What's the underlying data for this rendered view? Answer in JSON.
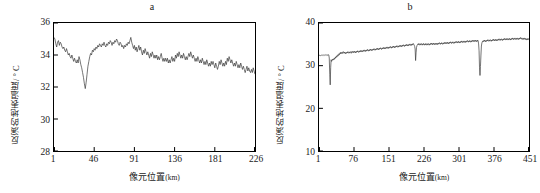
{
  "figure": {
    "panels": [
      {
        "id": "a",
        "title": "a",
        "ylabel": "反演的地表温度/ ° C",
        "xlabel_main": "像元位置",
        "xlabel_unit": "(km)"
      },
      {
        "id": "b",
        "title": "b",
        "ylabel": "反演的地表温度/ ° C",
        "xlabel_main": "像元位置",
        "xlabel_unit": "(km)"
      }
    ]
  },
  "chart_data": [
    {
      "type": "line",
      "title": "a",
      "xlabel": "像元位置(km)",
      "ylabel": "反演的地表温度/ ° C",
      "xlim": [
        1,
        226
      ],
      "ylim": [
        28,
        36
      ],
      "xticks": [
        1,
        46,
        91,
        136,
        181,
        226
      ],
      "yticks": [
        28,
        30,
        32,
        34,
        36
      ],
      "grid": false,
      "legend": "none",
      "line_color": "#3a3a3a",
      "series": [
        {
          "name": "反演的地表温度",
          "x_start": 1,
          "x_step": 1,
          "values": [
            35.1,
            35.0,
            34.7,
            34.5,
            34.8,
            34.9,
            34.6,
            34.8,
            34.7,
            34.5,
            34.4,
            34.5,
            34.3,
            34.2,
            34.4,
            34.2,
            34.0,
            34.1,
            33.9,
            33.8,
            34.0,
            33.8,
            33.6,
            33.8,
            33.6,
            33.5,
            33.7,
            33.5,
            33.9,
            33.7,
            33.4,
            33.2,
            32.9,
            32.6,
            32.2,
            31.9,
            32.3,
            32.8,
            33.3,
            33.6,
            33.9,
            34.1,
            34.0,
            34.3,
            34.2,
            34.4,
            34.3,
            34.5,
            34.4,
            34.6,
            34.5,
            34.7,
            34.6,
            34.5,
            34.7,
            34.6,
            34.8,
            34.6,
            34.5,
            34.7,
            34.6,
            34.8,
            34.7,
            34.9,
            34.8,
            34.6,
            34.8,
            34.7,
            34.9,
            34.8,
            35.0,
            34.9,
            34.7,
            34.6,
            34.8,
            34.7,
            34.5,
            34.6,
            34.4,
            34.6,
            34.5,
            34.7,
            34.6,
            34.8,
            34.7,
            34.9,
            35.1,
            34.8,
            34.6,
            34.4,
            34.6,
            34.3,
            34.5,
            34.2,
            34.4,
            34.6,
            34.3,
            34.5,
            34.2,
            34.0,
            34.3,
            34.1,
            34.4,
            34.2,
            34.0,
            34.2,
            34.0,
            33.8,
            34.1,
            33.9,
            34.2,
            34.0,
            33.8,
            34.0,
            33.8,
            34.0,
            33.7,
            33.9,
            33.7,
            33.9,
            34.1,
            33.8,
            33.6,
            33.8,
            33.6,
            33.8,
            33.6,
            33.8,
            33.5,
            33.7,
            33.5,
            33.7,
            33.9,
            33.6,
            33.8,
            33.6,
            34.0,
            33.8,
            34.1,
            33.9,
            34.2,
            34.0,
            33.8,
            34.0,
            33.8,
            34.1,
            33.9,
            33.7,
            33.9,
            33.7,
            33.9,
            34.1,
            33.9,
            34.2,
            34.0,
            33.8,
            34.0,
            33.8,
            33.6,
            33.8,
            33.6,
            33.9,
            33.7,
            33.5,
            33.7,
            33.5,
            33.8,
            33.6,
            33.4,
            33.6,
            33.4,
            33.7,
            33.5,
            33.3,
            33.5,
            33.3,
            33.6,
            33.4,
            33.6,
            33.4,
            33.2,
            33.5,
            33.3,
            33.1,
            33.3,
            33.6,
            33.4,
            33.7,
            33.5,
            33.3,
            33.5,
            33.3,
            33.6,
            33.4,
            33.8,
            33.6,
            33.9,
            33.7,
            33.5,
            33.7,
            33.5,
            33.3,
            33.5,
            33.3,
            33.6,
            33.4,
            33.2,
            33.4,
            33.2,
            33.5,
            33.3,
            33.1,
            33.3,
            33.1,
            32.9,
            33.1,
            33.3,
            33.0,
            33.2,
            33.0,
            32.9,
            33.1,
            32.9,
            33.2,
            33.0,
            32.8
          ]
        }
      ]
    },
    {
      "type": "line",
      "title": "b",
      "xlabel": "像元位置(km)",
      "ylabel": "反演的地表温度/ ° C",
      "xlim": [
        1,
        451
      ],
      "ylim": [
        10,
        40
      ],
      "xticks": [
        1,
        76,
        151,
        226,
        301,
        376,
        451
      ],
      "yticks": [
        10,
        20,
        30,
        40
      ],
      "grid": false,
      "legend": "none",
      "line_color": "#3a3a3a",
      "series": [
        {
          "name": "反演的地表温度",
          "x_start": 1,
          "x_step": 1,
          "values": [
            32.4,
            32.4,
            32.5,
            32.4,
            32.3,
            32.4,
            32.5,
            32.4,
            32.5,
            32.4,
            32.5,
            32.4,
            32.5,
            32.6,
            32.5,
            32.4,
            32.5,
            32.4,
            32.5,
            32.4,
            32.6,
            32.5,
            31.8,
            28.0,
            25.5,
            29.5,
            31.4,
            31.0,
            31.2,
            31.5,
            31.3,
            31.6,
            31.4,
            31.8,
            31.6,
            32.0,
            31.8,
            32.2,
            32.0,
            32.4,
            32.2,
            32.6,
            32.4,
            32.8,
            32.6,
            33.0,
            32.8,
            33.2,
            33.0,
            32.8,
            33.1,
            32.9,
            33.3,
            33.1,
            32.9,
            33.2,
            33.0,
            32.8,
            33.1,
            32.9,
            33.2,
            33.0,
            33.3,
            33.1,
            32.9,
            33.2,
            33.0,
            33.3,
            33.1,
            32.9,
            33.2,
            33.4,
            33.2,
            33.0,
            33.3,
            33.1,
            33.4,
            33.2,
            33.0,
            33.3,
            33.1,
            33.4,
            33.2,
            33.5,
            33.3,
            33.1,
            33.4,
            33.2,
            33.5,
            33.3,
            33.6,
            33.4,
            33.2,
            33.5,
            33.3,
            33.6,
            33.4,
            33.7,
            33.5,
            33.3,
            33.6,
            33.4,
            33.7,
            33.5,
            33.8,
            33.6,
            33.4,
            33.7,
            33.5,
            33.8,
            33.6,
            33.9,
            33.7,
            33.5,
            33.8,
            33.6,
            33.9,
            33.7,
            34.0,
            33.8,
            33.6,
            33.9,
            33.7,
            34.0,
            33.8,
            34.1,
            33.9,
            33.7,
            34.0,
            33.8,
            34.1,
            33.9,
            34.2,
            34.0,
            33.8,
            34.1,
            33.9,
            34.2,
            34.0,
            34.3,
            34.1,
            33.9,
            34.2,
            34.0,
            34.3,
            34.1,
            34.4,
            34.2,
            34.0,
            34.3,
            34.1,
            34.4,
            34.2,
            34.5,
            34.3,
            34.1,
            34.4,
            34.2,
            34.5,
            34.3,
            34.6,
            34.4,
            34.2,
            34.5,
            34.3,
            34.6,
            34.4,
            34.7,
            34.5,
            34.3,
            34.6,
            34.4,
            34.7,
            34.5,
            34.8,
            34.6,
            34.4,
            34.7,
            34.5,
            34.8,
            34.6,
            34.9,
            34.7,
            34.5,
            34.8,
            34.6,
            34.9,
            34.7,
            35.0,
            34.8,
            34.6,
            34.9,
            34.7,
            35.0,
            34.8,
            35.1,
            34.9,
            34.7,
            35.0,
            34.8,
            35.1,
            34.9,
            35.2,
            35.0,
            34.8,
            34.5,
            33.9,
            31.2,
            33.0,
            34.3,
            34.7,
            34.9,
            35.1,
            34.9,
            35.2,
            35.0,
            34.8,
            35.1,
            34.9,
            35.2,
            35.0,
            34.8,
            35.1,
            34.9,
            35.2,
            35.0,
            34.8,
            35.1,
            34.9,
            35.2,
            35.0,
            34.8,
            35.1,
            34.9,
            35.2,
            35.0,
            34.8,
            35.1,
            34.9,
            35.2,
            35.0,
            35.3,
            35.1,
            34.9,
            35.2,
            35.0,
            35.3,
            35.1,
            34.9,
            35.2,
            35.0,
            35.3,
            35.1,
            34.9,
            35.2,
            35.0,
            35.3,
            35.1,
            35.4,
            35.2,
            35.0,
            35.3,
            35.1,
            35.4,
            35.2,
            35.0,
            35.3,
            35.1,
            35.4,
            35.2,
            35.5,
            35.3,
            35.1,
            35.4,
            35.2,
            35.5,
            35.3,
            35.1,
            35.4,
            35.2,
            35.5,
            35.3,
            35.6,
            35.4,
            35.2,
            35.5,
            35.3,
            35.6,
            35.4,
            35.2,
            35.5,
            35.3,
            35.6,
            35.4,
            35.7,
            35.5,
            35.3,
            35.6,
            35.4,
            35.7,
            35.5,
            35.3,
            35.6,
            35.4,
            35.7,
            35.5,
            35.8,
            35.6,
            35.4,
            35.7,
            35.5,
            35.8,
            35.6,
            35.4,
            35.7,
            35.5,
            35.8,
            35.6,
            35.9,
            35.7,
            35.5,
            35.8,
            35.6,
            35.9,
            35.7,
            35.5,
            35.8,
            35.6,
            35.9,
            35.7,
            36.0,
            35.8,
            35.6,
            35.9,
            35.7,
            36.0,
            35.8,
            35.6,
            35.9,
            35.7,
            36.0,
            35.8,
            35.1,
            33.5,
            29.5,
            27.7,
            29.8,
            32.5,
            34.6,
            35.3,
            35.6,
            35.8,
            35.6,
            35.9,
            35.7,
            36.0,
            35.8,
            35.6,
            35.9,
            35.7,
            36.0,
            35.8,
            36.1,
            35.9,
            35.7,
            36.0,
            35.8,
            36.1,
            35.9,
            35.7,
            36.0,
            35.8,
            36.1,
            35.9,
            36.2,
            36.0,
            35.8,
            36.1,
            35.9,
            36.2,
            36.0,
            35.8,
            36.1,
            35.9,
            36.2,
            36.0,
            36.3,
            36.1,
            35.9,
            36.2,
            36.0,
            36.3,
            36.1,
            35.9,
            36.2,
            36.0,
            36.3,
            36.1,
            36.4,
            36.2,
            36.0,
            36.3,
            36.1,
            36.4,
            36.2,
            36.0,
            36.3,
            36.1,
            36.4,
            36.2,
            36.0,
            36.3,
            36.1,
            36.4,
            36.2,
            36.5,
            36.3,
            36.1,
            36.4,
            36.2,
            36.5,
            36.3,
            36.1,
            36.4,
            36.2,
            36.5,
            36.3,
            36.1,
            36.4,
            36.2,
            36.5,
            36.3,
            36.6,
            36.4,
            36.2,
            36.5,
            36.3,
            36.1,
            36.4,
            36.2,
            36.5,
            36.3,
            36.1,
            36.4,
            36.2,
            36.0,
            36.3,
            36.1,
            36.4,
            36.2,
            36.0
          ]
        }
      ]
    }
  ]
}
